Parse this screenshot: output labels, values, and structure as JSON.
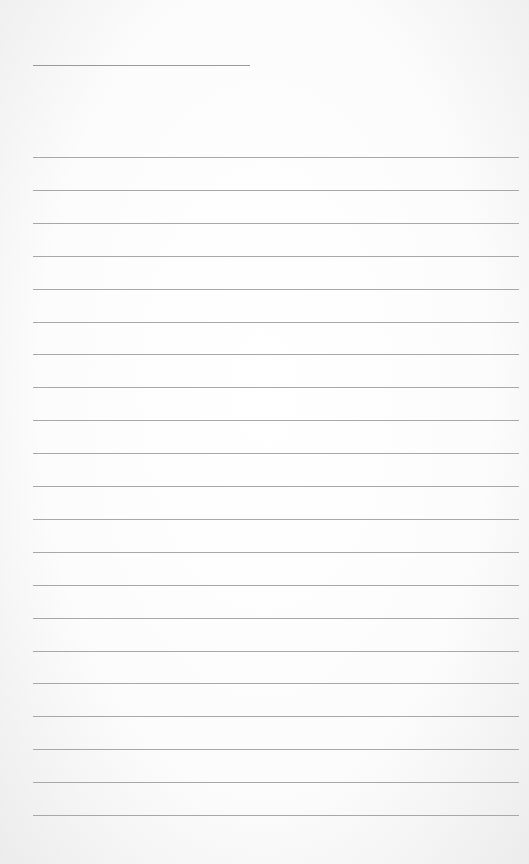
{
  "page": {
    "type": "lined-paper",
    "background": "#ffffff",
    "line_color": "#a8a8a8",
    "title_line": {
      "x": 33,
      "y": 65,
      "width": 217
    },
    "rules": {
      "count": 21,
      "start_y": 157,
      "spacing": 32.9,
      "x": 33,
      "width": 486
    }
  }
}
